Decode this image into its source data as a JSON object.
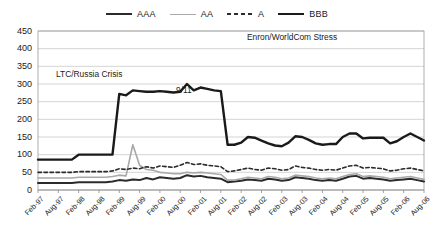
{
  "legend": {
    "position": "top-center",
    "items": [
      {
        "name": "AAA",
        "style": "solid",
        "color": "#2b2b2b",
        "width": 2.0
      },
      {
        "name": "AA",
        "style": "solid",
        "color": "#a8a8a8",
        "width": 1.6
      },
      {
        "name": "A",
        "style": "dashed",
        "color": "#2b2b2b",
        "width": 1.6
      },
      {
        "name": "BBB",
        "style": "solid",
        "color": "#1a1a1a",
        "width": 2.4
      }
    ]
  },
  "annotations": [
    {
      "id": "ltc",
      "text": "LTC/Russia Crisis"
    },
    {
      "id": "911",
      "text": "9/11"
    },
    {
      "id": "enron",
      "text": "Enron/WorldCom Stress"
    }
  ],
  "chart_data": {
    "type": "line",
    "title": "",
    "xlabel": "",
    "ylabel": "",
    "ylim": [
      0,
      450
    ],
    "ytick_step": 50,
    "yticks": [
      0,
      50,
      100,
      150,
      200,
      250,
      300,
      350,
      400,
      450
    ],
    "grid": "horizontal",
    "xticks": [
      "Feb-97",
      "Aug-97",
      "Feb-98",
      "Aug-98",
      "Feb-99",
      "Aug-99",
      "Feb-00",
      "Aug-00",
      "Feb-01",
      "Aug-01",
      "Feb-02",
      "Aug-02",
      "Feb-03",
      "Aug-03",
      "Feb-04",
      "Aug-04",
      "Feb-05",
      "Aug-05",
      "Feb-06",
      "Aug-06"
    ],
    "x": [
      "Feb-97",
      "Apr-97",
      "Jun-97",
      "Aug-97",
      "Oct-97",
      "Dec-97",
      "Feb-98",
      "Apr-98",
      "Jun-98",
      "Aug-98",
      "Oct-98",
      "Dec-98",
      "Feb-99",
      "Apr-99",
      "Jun-99",
      "Aug-99",
      "Oct-99",
      "Dec-99",
      "Feb-00",
      "Apr-00",
      "Jun-00",
      "Aug-00",
      "Oct-00",
      "Dec-00",
      "Feb-01",
      "Apr-01",
      "Jun-01",
      "Aug-01",
      "Oct-01",
      "Dec-01",
      "Feb-02",
      "Apr-02",
      "Jun-02",
      "Aug-02",
      "Oct-02",
      "Dec-02",
      "Feb-03",
      "Apr-03",
      "Jun-03",
      "Aug-03",
      "Oct-03",
      "Dec-03",
      "Feb-04",
      "Apr-04",
      "Jun-04",
      "Aug-04",
      "Oct-04",
      "Dec-04",
      "Feb-05",
      "Apr-05",
      "Jun-05",
      "Aug-05",
      "Oct-05",
      "Dec-05",
      "Feb-06",
      "Apr-06",
      "Jun-06",
      "Aug-06"
    ],
    "series": [
      {
        "name": "BBB",
        "color": "#1a1a1a",
        "style": "solid",
        "width": 2.4,
        "values": [
          86,
          86,
          86,
          86,
          86,
          86,
          100,
          100,
          100,
          100,
          100,
          100,
          272,
          268,
          282,
          280,
          278,
          278,
          280,
          278,
          276,
          278,
          300,
          282,
          290,
          286,
          282,
          280,
          128,
          128,
          134,
          150,
          148,
          140,
          132,
          126,
          124,
          134,
          152,
          150,
          142,
          132,
          128,
          130,
          130,
          150,
          160,
          160,
          146,
          148,
          148,
          148,
          132,
          138,
          150,
          160,
          150,
          140
        ]
      },
      {
        "name": "A",
        "color": "#2b2b2b",
        "style": "dashed",
        "width": 1.6,
        "values": [
          50,
          50,
          50,
          50,
          50,
          50,
          52,
          52,
          52,
          52,
          52,
          54,
          60,
          58,
          62,
          60,
          66,
          62,
          68,
          66,
          64,
          70,
          78,
          72,
          74,
          70,
          68,
          66,
          52,
          54,
          58,
          62,
          58,
          56,
          62,
          60,
          56,
          58,
          68,
          64,
          62,
          58,
          56,
          58,
          56,
          62,
          68,
          70,
          62,
          64,
          62,
          60,
          54,
          56,
          60,
          62,
          58,
          54
        ]
      },
      {
        "name": "AA",
        "color": "#a8a8a8",
        "style": "solid",
        "width": 1.6,
        "values": [
          34,
          34,
          34,
          34,
          34,
          34,
          36,
          36,
          36,
          36,
          36,
          38,
          42,
          40,
          128,
          70,
          58,
          56,
          50,
          48,
          46,
          46,
          50,
          48,
          50,
          48,
          46,
          44,
          28,
          28,
          32,
          36,
          34,
          32,
          38,
          36,
          32,
          34,
          42,
          40,
          38,
          34,
          32,
          34,
          32,
          38,
          44,
          46,
          38,
          40,
          38,
          36,
          32,
          34,
          36,
          38,
          34,
          30
        ]
      },
      {
        "name": "AAA",
        "color": "#2b2b2b",
        "style": "solid",
        "width": 2.0,
        "values": [
          20,
          20,
          20,
          20,
          20,
          20,
          22,
          22,
          22,
          22,
          22,
          24,
          28,
          26,
          30,
          28,
          34,
          30,
          36,
          34,
          32,
          34,
          42,
          38,
          40,
          36,
          34,
          32,
          22,
          24,
          26,
          30,
          28,
          26,
          32,
          30,
          26,
          28,
          36,
          34,
          32,
          28,
          26,
          28,
          26,
          32,
          38,
          40,
          32,
          34,
          32,
          30,
          26,
          28,
          30,
          32,
          28,
          24
        ]
      }
    ],
    "series_detailed": {
      "note": "Monthly credit spread (basis points) readings traced from plot",
      "BBB": {
        "start": 86,
        "ltc_peak": 300,
        "sept11_level": 215,
        "enron_peak": 400,
        "end": 100,
        "late_spike": 215
      },
      "A": {
        "start": 50,
        "ltc_peak": 105,
        "enron_peak": 170,
        "end": 42
      },
      "AA": {
        "start": 34,
        "ltc_peak": 130,
        "enron_peak": 115,
        "end": 28
      },
      "AAA": {
        "start": 20,
        "ltc_peak": 48,
        "enron_peak": 45,
        "end": 18
      }
    }
  }
}
